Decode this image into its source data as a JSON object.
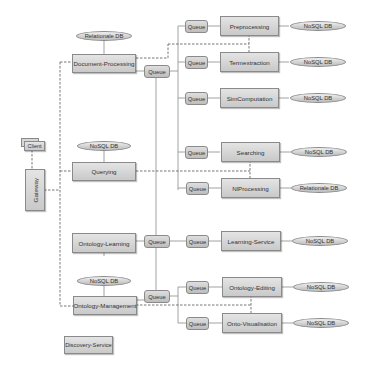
{
  "diagram": {
    "type": "microservice-architecture",
    "colors": {
      "box_fill_top": "#e4e4e4",
      "box_fill_bottom": "#c9c9c9",
      "border": "#8a8a8a",
      "connector": "#8a8a8a",
      "dashed_connector": "#555555",
      "text": "#333333"
    },
    "client": {
      "label": "Client"
    },
    "gateway": {
      "label": "Gateway"
    },
    "discovery": {
      "label": "Discovery-Service"
    },
    "core_services": [
      {
        "label": "Document-Processing",
        "db": "Relationale DB",
        "queue": "Queue"
      },
      {
        "label": "Querying",
        "db": "NoSQL DB"
      },
      {
        "label": "Ontology-Learning",
        "db": "NoSQL DB",
        "queue": "Queue"
      },
      {
        "label": "Ontology-Management",
        "db": "NoSQL DB",
        "queue": "Queue"
      }
    ],
    "worker_services": [
      {
        "label": "Preprocessing",
        "queue": "Queue",
        "db": "NoSQL DB"
      },
      {
        "label": "Termextraction",
        "queue": "Queue",
        "db": "NoSQL DB"
      },
      {
        "label": "SimComputation",
        "queue": "Queue",
        "db": "NoSQL DB"
      },
      {
        "label": "Searching",
        "queue": "Queue",
        "db": "NoSQL DB"
      },
      {
        "label": "NlProcessing",
        "queue": "Queue",
        "db": "Relationale DB"
      },
      {
        "label": "Learning-Service",
        "queue": "Queue",
        "db": "NoSQL DB"
      },
      {
        "label": "Ontology-Editing",
        "queue": "Queue",
        "db": "NoSQL DB"
      },
      {
        "label": "Onto-Visualisation",
        "queue": "Queue",
        "db": "NoSQL DB"
      }
    ]
  }
}
